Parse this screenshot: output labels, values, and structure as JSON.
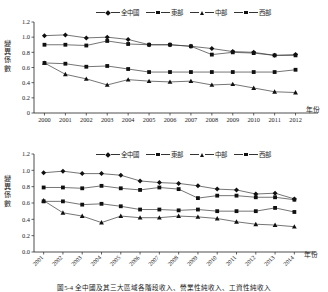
{
  "figure": {
    "caption": "圖5-4   全中國及其三大區域各階段收入、營業性純收入、工資性純收入"
  },
  "legend": {
    "items": [
      {
        "label": "全中國",
        "marker": "diamond"
      },
      {
        "label": "東部",
        "marker": "square"
      },
      {
        "label": "中部",
        "marker": "triangle"
      },
      {
        "label": "西部",
        "marker": "square"
      }
    ]
  },
  "axis_names": {
    "y": "變異係數",
    "x": "年份"
  },
  "chart_data": [
    {
      "type": "line",
      "id": "top",
      "title": "",
      "xlabel": "年份",
      "ylabel": "變異係數",
      "ylim": [
        0,
        1.2
      ],
      "yticks": [
        "0",
        "0.2",
        "0.4",
        "0.6",
        "0.8",
        "1.0",
        "1.2"
      ],
      "ytick_values": [
        0,
        0.2,
        0.4,
        0.6,
        0.8,
        1.0,
        1.2
      ],
      "grid": false,
      "legend_position": "top",
      "categories": [
        "2000",
        "2001",
        "2002",
        "2003",
        "2004",
        "2005",
        "2006",
        "2007",
        "2008",
        "2009",
        "2010",
        "2011",
        "2012"
      ],
      "series": [
        {
          "name": "全中國",
          "marker": "diamond",
          "values": [
            1.02,
            1.03,
            0.99,
            1.0,
            0.97,
            0.9,
            0.9,
            0.88,
            0.85,
            0.81,
            0.8,
            0.76,
            0.77
          ]
        },
        {
          "name": "東部",
          "marker": "square",
          "values": [
            0.66,
            0.65,
            0.61,
            0.62,
            0.58,
            0.54,
            0.54,
            0.54,
            0.54,
            0.54,
            0.54,
            0.54,
            0.57
          ]
        },
        {
          "name": "中部",
          "marker": "triangle",
          "values": [
            0.66,
            0.51,
            0.45,
            0.37,
            0.44,
            0.42,
            0.41,
            0.42,
            0.37,
            0.38,
            0.33,
            0.28,
            0.27
          ]
        },
        {
          "name": "西部",
          "marker": "square",
          "values": [
            0.9,
            0.9,
            0.89,
            0.95,
            0.91,
            0.9,
            0.9,
            0.88,
            0.77,
            0.8,
            0.79,
            0.76,
            0.76
          ]
        }
      ]
    },
    {
      "type": "line",
      "id": "bottom",
      "title": "",
      "xlabel": "年份",
      "ylabel": "變異係數",
      "ylim": [
        0,
        1.2
      ],
      "yticks": [
        "0.0",
        "0.2",
        "0.4",
        "0.6",
        "0.8",
        "1.0",
        "1.2"
      ],
      "ytick_values": [
        0,
        0.2,
        0.4,
        0.6,
        0.8,
        1.0,
        1.2
      ],
      "grid": false,
      "legend_position": "top",
      "categories": [
        "2001",
        "2002",
        "2003",
        "2004",
        "2005",
        "2006",
        "2007",
        "2008",
        "2009",
        "2010",
        "2011",
        "2012",
        "2013",
        "2014"
      ],
      "series": [
        {
          "name": "全中國",
          "marker": "diamond",
          "values": [
            0.97,
            0.99,
            0.96,
            0.96,
            0.94,
            0.87,
            0.85,
            0.84,
            0.81,
            0.77,
            0.76,
            0.71,
            0.72,
            0.65
          ]
        },
        {
          "name": "東部",
          "marker": "square",
          "values": [
            0.62,
            0.62,
            0.58,
            0.59,
            0.56,
            0.52,
            0.52,
            0.51,
            0.52,
            0.5,
            0.5,
            0.5,
            0.54,
            0.49
          ]
        },
        {
          "name": "中部",
          "marker": "triangle",
          "values": [
            0.63,
            0.48,
            0.44,
            0.36,
            0.44,
            0.42,
            0.42,
            0.44,
            0.43,
            0.41,
            0.37,
            0.34,
            0.33,
            0.31
          ]
        },
        {
          "name": "西部",
          "marker": "square",
          "values": [
            0.79,
            0.79,
            0.78,
            0.81,
            0.78,
            0.76,
            0.79,
            0.77,
            0.66,
            0.69,
            0.69,
            0.67,
            0.67,
            0.64
          ]
        }
      ]
    }
  ]
}
